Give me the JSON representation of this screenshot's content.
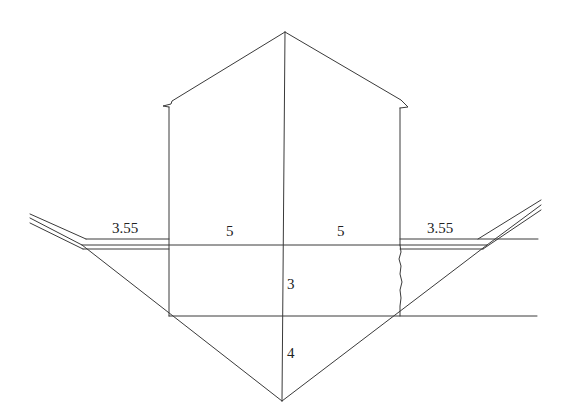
{
  "diagram": {
    "type": "cross-section",
    "labels": {
      "left_berm_width": "3.55",
      "left_half_width": "5",
      "right_half_width": "5",
      "right_berm_width": "3.55",
      "upper_depth": "3",
      "lower_depth": "4"
    },
    "stroke_color": "#3a3a3a",
    "background": "#ffffff"
  }
}
